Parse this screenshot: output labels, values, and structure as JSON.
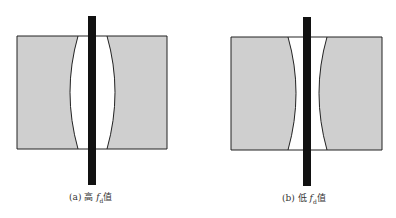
{
  "colors": {
    "fill": "#cfcfcf",
    "stroke": "#222222",
    "bar": "#111111",
    "gap": "#ffffff"
  },
  "panels": [
    {
      "id": "a",
      "caption_prefix": "(a) 高",
      "caption_symbol": "f",
      "caption_subscript": "d",
      "caption_suffix": "值",
      "gap_shape": "convex"
    },
    {
      "id": "b",
      "caption_prefix": "(b) 低",
      "caption_symbol": "f",
      "caption_subscript": "d",
      "caption_suffix": "值",
      "gap_shape": "concave"
    }
  ]
}
